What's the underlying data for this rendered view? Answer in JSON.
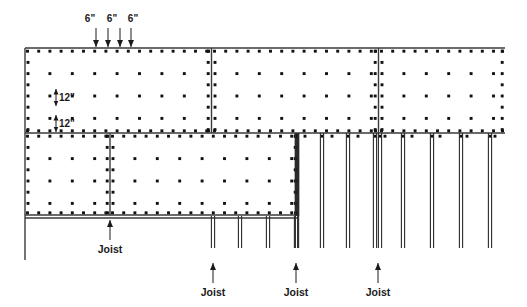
{
  "diagram": {
    "colors": {
      "line": "#3a3a3a",
      "heavy_line": "#2b2b2b",
      "nail": "#111111",
      "text": "#1a1a1a",
      "background": "#ffffff"
    },
    "canvas": {
      "width": 527,
      "height": 307
    }
  },
  "dimension_labels": {
    "edge_spacing": [
      {
        "text": "6\"",
        "x": 97,
        "y": 22
      },
      {
        "text": "6\"",
        "x": 114,
        "y": 22
      },
      {
        "text": "6\"",
        "x": 131,
        "y": 22
      }
    ],
    "field_spacing": [
      {
        "text": "12\"",
        "x": 60,
        "y": 98
      },
      {
        "text": "12\"",
        "x": 60,
        "y": 124
      }
    ]
  },
  "callouts": [
    {
      "label": "Joist",
      "x": 110,
      "y": 253,
      "arrow_x": 110,
      "arrow_top": 220,
      "arrow_bottom": 240
    },
    {
      "label": "Joist",
      "x": 213,
      "y": 296,
      "arrow_x": 213,
      "arrow_top": 263,
      "arrow_bottom": 283
    },
    {
      "label": "Joist",
      "x": 296,
      "y": 296,
      "arrow_x": 296,
      "arrow_top": 263,
      "arrow_bottom": 283
    },
    {
      "label": "Joist",
      "x": 378,
      "y": 296,
      "arrow_x": 378,
      "arrow_top": 263,
      "arrow_bottom": 283
    }
  ],
  "top_arrows": [
    {
      "x": 96,
      "top": 28,
      "bottom": 47
    },
    {
      "x": 108,
      "top": 28,
      "bottom": 47
    },
    {
      "x": 120,
      "top": 28,
      "bottom": 47
    },
    {
      "x": 131,
      "top": 28,
      "bottom": 47
    }
  ],
  "sheathing_panels": {
    "upper_row": [
      {
        "name": "upper-panel-left",
        "x": 25,
        "y": 48,
        "w": 186,
        "h": 85
      },
      {
        "name": "upper-panel-middle",
        "x": 212,
        "y": 48,
        "w": 166,
        "h": 85
      },
      {
        "name": "upper-panel-right",
        "x": 379,
        "y": 48,
        "w": 126,
        "h": 85
      }
    ],
    "lower_row": [
      {
        "name": "lower-panel-left",
        "x": 25,
        "y": 133,
        "w": 85,
        "h": 82
      },
      {
        "name": "lower-panel-right",
        "x": 110,
        "y": 133,
        "w": 188,
        "h": 82
      }
    ]
  },
  "joists": {
    "exposed_right": [
      297,
      322,
      348,
      375,
      380,
      403,
      432,
      461,
      490
    ],
    "exposed_center_stubs": [
      213,
      240,
      268,
      296
    ],
    "rim_joist_x": 297
  },
  "geometry_notes": {
    "top_edge_y": 48,
    "mid_edge_y": 133,
    "lower_edge_y": 215,
    "left_edge_x": 25,
    "right_edge_x": 505,
    "joist_bottom_y": 248,
    "stub_bottom_y": 248
  }
}
